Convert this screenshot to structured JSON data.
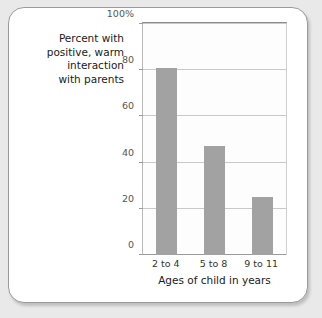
{
  "chart_data": {
    "type": "bar",
    "title": "",
    "categories": [
      "2 to 4",
      "5 to 8",
      "9 to 11"
    ],
    "values": [
      81,
      47,
      25
    ],
    "xlabel": "Ages of child in years",
    "ylabel": "Percent with\npositive, warm\ninteraction\nwith parents",
    "ylim": [
      0,
      100
    ],
    "ytick_labels": [
      "100%",
      "80",
      "60",
      "40",
      "20",
      "0"
    ],
    "ytick_values": [
      100,
      80,
      60,
      40,
      20,
      0
    ],
    "grid": true,
    "legend": "none",
    "bar_color": "#a2a2a2",
    "gridline_color": "#c9c9c9",
    "axis_color": "#9b9b9b",
    "frame_color": "#9a9a9a",
    "background_color": "#ffffff",
    "page_color": "#e9e9e9"
  },
  "axis": {
    "y_title": "Percent with\npositive, warm\ninteraction\nwith parents",
    "x_title": "Ages of child in years",
    "y_ticks": [
      {
        "label": "100%",
        "value": 100
      },
      {
        "label": "80",
        "value": 80
      },
      {
        "label": "60",
        "value": 60
      },
      {
        "label": "40",
        "value": 40
      },
      {
        "label": "20",
        "value": 20
      },
      {
        "label": "0",
        "value": 0
      }
    ],
    "x_ticks": [
      {
        "label": "2 to 4"
      },
      {
        "label": "5 to 8"
      },
      {
        "label": "9 to 11"
      }
    ]
  }
}
